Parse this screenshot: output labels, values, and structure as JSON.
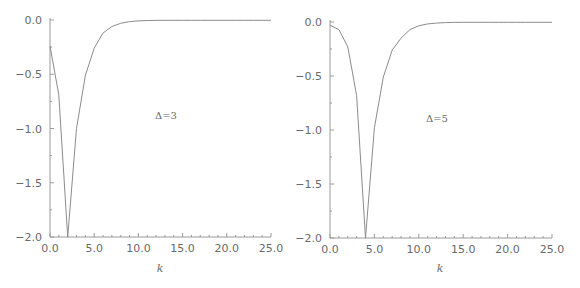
{
  "chart_data": [
    {
      "type": "line",
      "title": "",
      "annotation": "Δ=3",
      "xlabel": "k",
      "ylabel": "",
      "xlim": [
        0,
        25
      ],
      "ylim": [
        -2.0,
        0.0
      ],
      "xticks": [
        "0.0",
        "5.0",
        "10.0",
        "15.0",
        "20.0",
        "25.0"
      ],
      "yticks": [
        "0.0",
        "-0.5",
        "-1.0",
        "-1.5",
        "-2.0"
      ],
      "grid": false,
      "legend": null,
      "series": [
        {
          "name": "Δ=3",
          "x": [
            0,
            1,
            2,
            3,
            4,
            5,
            6,
            7,
            8,
            9,
            10,
            11,
            12,
            13,
            14,
            15,
            16,
            17,
            18,
            19,
            20,
            21,
            22,
            23,
            24,
            25
          ],
          "y": [
            -0.24,
            -0.69,
            -2.0,
            -1.0,
            -0.51,
            -0.26,
            -0.12,
            -0.06,
            -0.03,
            -0.015,
            -0.008,
            -0.005,
            -0.004,
            -0.003,
            -0.003,
            -0.003,
            -0.003,
            -0.003,
            -0.003,
            -0.003,
            -0.003,
            -0.003,
            -0.003,
            -0.003,
            -0.003,
            -0.003
          ]
        }
      ]
    },
    {
      "type": "line",
      "title": "",
      "annotation": "Δ=5",
      "xlabel": "k",
      "ylabel": "",
      "xlim": [
        0,
        25
      ],
      "ylim": [
        -2.0,
        0.0
      ],
      "xticks": [
        "0.0",
        "5.0",
        "10.0",
        "15.0",
        "20.0",
        "25.0"
      ],
      "yticks": [
        "0.0",
        "-0.5",
        "-1.0",
        "-1.5",
        "-2.0"
      ],
      "grid": false,
      "legend": null,
      "series": [
        {
          "name": "Δ=5",
          "x": [
            0,
            1,
            2,
            3,
            4,
            5,
            6,
            7,
            8,
            9,
            10,
            11,
            12,
            13,
            14,
            15,
            16,
            17,
            18,
            19,
            20,
            21,
            22,
            23,
            24,
            25
          ],
          "y": [
            -0.03,
            -0.07,
            -0.23,
            -0.68,
            -2.0,
            -0.98,
            -0.51,
            -0.26,
            -0.15,
            -0.07,
            -0.035,
            -0.018,
            -0.01,
            -0.006,
            -0.004,
            -0.003,
            -0.003,
            -0.003,
            -0.003,
            -0.003,
            -0.003,
            -0.003,
            -0.003,
            -0.003,
            -0.003,
            -0.003
          ]
        }
      ]
    }
  ],
  "style": {
    "axis_color": "#9a9a9a",
    "line_color": "#8c8c8c",
    "text_color": "#6a6a6a"
  }
}
